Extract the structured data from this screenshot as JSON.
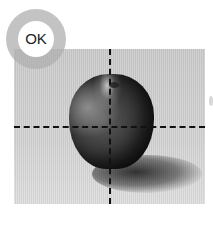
{
  "badge": {
    "label": "OK",
    "ring_color": "#afafaf"
  },
  "photo": {
    "subject": "apple",
    "guides": {
      "vertical_x": 109,
      "horizontal_y": 126,
      "style": "dashed"
    }
  }
}
